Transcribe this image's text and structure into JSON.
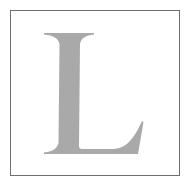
{
  "glyph": {
    "character": "L",
    "style": "serif",
    "color": "#a9a9a9"
  },
  "frame": {
    "border_color": "#6e6e6e",
    "background": "#ffffff"
  }
}
